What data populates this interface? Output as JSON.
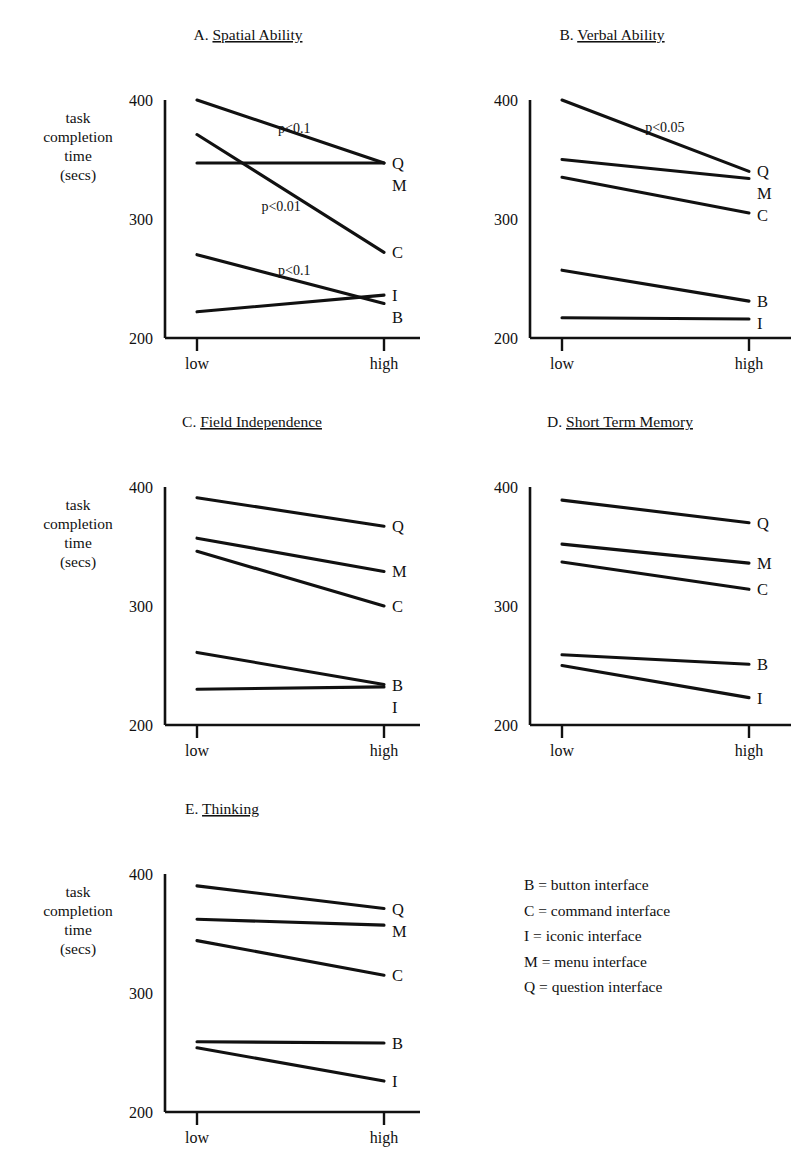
{
  "figure": {
    "y_axis_label_lines": [
      "task",
      "completion",
      "time",
      "(secs)"
    ],
    "y_ticks": [
      200,
      300,
      400
    ],
    "x_ticks": [
      "low",
      "high"
    ],
    "series_order": [
      "Q",
      "M",
      "C",
      "B",
      "I"
    ]
  },
  "legend": {
    "items": [
      "B = button interface",
      "C = command interface",
      "I = iconic interface",
      "M = menu interface",
      "Q = question interface"
    ]
  },
  "chart_data": [
    {
      "type": "line",
      "panel": "A",
      "title": "A.",
      "title_underlined": "Spatial Ability",
      "xlabel": "",
      "ylabel": "task completion time (secs)",
      "x": [
        "low",
        "high"
      ],
      "ylim": [
        200,
        400
      ],
      "yticks": [
        200,
        300,
        400
      ],
      "grid": false,
      "legend_position": "right-of-line-ends",
      "series": [
        {
          "name": "Q",
          "values": [
            400,
            347
          ]
        },
        {
          "name": "M",
          "values": [
            347,
            347
          ]
        },
        {
          "name": "C",
          "values": [
            371,
            272
          ]
        },
        {
          "name": "I",
          "values": [
            222,
            236
          ]
        },
        {
          "name": "B",
          "values": [
            270,
            229
          ]
        }
      ],
      "annotations": [
        {
          "text": "p<0.1",
          "x": 0.52,
          "y": 372,
          "series": "Q"
        },
        {
          "text": "p<0.01",
          "x": 0.45,
          "y": 307,
          "series": "C"
        },
        {
          "text": "p<0.1",
          "x": 0.52,
          "y": 253,
          "series": "B"
        }
      ]
    },
    {
      "type": "line",
      "panel": "B",
      "title": "B.",
      "title_underlined": "Verbal Ability",
      "xlabel": "",
      "ylabel": "task completion time (secs)",
      "x": [
        "low",
        "high"
      ],
      "ylim": [
        200,
        400
      ],
      "yticks": [
        200,
        300,
        400
      ],
      "grid": false,
      "legend_position": "right-of-line-ends",
      "series": [
        {
          "name": "Q",
          "values": [
            400,
            340
          ]
        },
        {
          "name": "M",
          "values": [
            350,
            334
          ]
        },
        {
          "name": "C",
          "values": [
            335,
            305
          ]
        },
        {
          "name": "B",
          "values": [
            257,
            231
          ]
        },
        {
          "name": "I",
          "values": [
            217,
            216
          ]
        }
      ],
      "annotations": [
        {
          "text": "p<0.05",
          "x": 0.55,
          "y": 373,
          "series": "Q"
        }
      ]
    },
    {
      "type": "line",
      "panel": "C",
      "title": "C.",
      "title_underlined": "Field Independence",
      "xlabel": "",
      "ylabel": "task completion time (secs)",
      "x": [
        "low",
        "high"
      ],
      "ylim": [
        200,
        400
      ],
      "yticks": [
        200,
        300,
        400
      ],
      "grid": false,
      "legend_position": "right-of-line-ends",
      "series": [
        {
          "name": "Q",
          "values": [
            391,
            367
          ]
        },
        {
          "name": "M",
          "values": [
            357,
            329
          ]
        },
        {
          "name": "C",
          "values": [
            346,
            300
          ]
        },
        {
          "name": "B",
          "values": [
            261,
            234
          ]
        },
        {
          "name": "I",
          "values": [
            230,
            232
          ]
        }
      ],
      "annotations": []
    },
    {
      "type": "line",
      "panel": "D",
      "title": "D.",
      "title_underlined": "Short Term Memory",
      "xlabel": "",
      "ylabel": "task completion time (secs)",
      "x": [
        "low",
        "high"
      ],
      "ylim": [
        200,
        400
      ],
      "yticks": [
        200,
        300,
        400
      ],
      "grid": false,
      "legend_position": "right-of-line-ends",
      "series": [
        {
          "name": "Q",
          "values": [
            389,
            370
          ]
        },
        {
          "name": "M",
          "values": [
            352,
            336
          ]
        },
        {
          "name": "C",
          "values": [
            337,
            314
          ]
        },
        {
          "name": "B",
          "values": [
            259,
            251
          ]
        },
        {
          "name": "I",
          "values": [
            250,
            223
          ]
        }
      ],
      "annotations": []
    },
    {
      "type": "line",
      "panel": "E",
      "title": "E.",
      "title_underlined": "Thinking",
      "xlabel": "",
      "ylabel": "task completion time (secs)",
      "x": [
        "low",
        "high"
      ],
      "ylim": [
        200,
        400
      ],
      "yticks": [
        200,
        300,
        400
      ],
      "grid": false,
      "legend_position": "right-of-line-ends",
      "series": [
        {
          "name": "Q",
          "values": [
            390,
            371
          ]
        },
        {
          "name": "M",
          "values": [
            362,
            357
          ]
        },
        {
          "name": "C",
          "values": [
            344,
            315
          ]
        },
        {
          "name": "B",
          "values": [
            259,
            258
          ]
        },
        {
          "name": "I",
          "values": [
            254,
            226
          ]
        }
      ],
      "annotations": []
    }
  ]
}
